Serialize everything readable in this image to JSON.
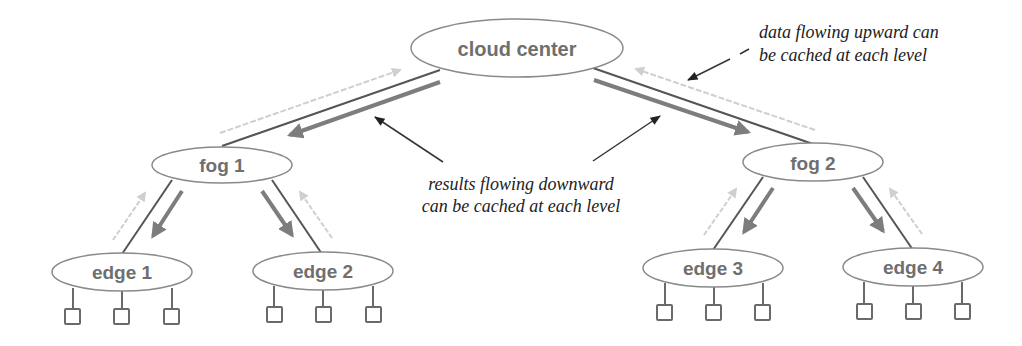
{
  "diagram": {
    "colors": {
      "node_stroke": "#8a8a8a",
      "node_text": "#6f6f6f",
      "link": "#555555",
      "down_arrow": "#7d7d7d",
      "up_arrow": "#cfcfcf",
      "annotation_text": "#222222",
      "annotation_arrow": "#333333"
    },
    "nodes": {
      "cloud": {
        "label": "cloud center"
      },
      "fog1": {
        "label": "fog 1"
      },
      "fog2": {
        "label": "fog 2"
      },
      "edge1": {
        "label": "edge 1",
        "devices": 3
      },
      "edge2": {
        "label": "edge 2",
        "devices": 3
      },
      "edge3": {
        "label": "edge 3",
        "devices": 3
      },
      "edge4": {
        "label": "edge 4",
        "devices": 3
      }
    },
    "annotations": {
      "upward": {
        "line1": "data flowing upward can",
        "line2": "be cached at each level"
      },
      "downward": {
        "line1": "results flowing downward",
        "line2": "can be cached at each level"
      }
    }
  }
}
